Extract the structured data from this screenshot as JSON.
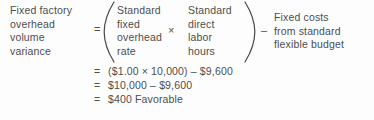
{
  "figure": {
    "type": "accounting-formula",
    "variance_label": {
      "lines": [
        "Fixed factory",
        "overhead",
        "volume",
        "variance"
      ]
    },
    "operators": {
      "equals": "=",
      "times": "×",
      "minus": "–",
      "open_paren": "(",
      "close_paren": ")"
    },
    "factor_one": {
      "lines": [
        "Standard",
        "fixed",
        "overhead",
        "rate"
      ]
    },
    "factor_two": {
      "lines": [
        "Standard",
        "direct",
        "labor",
        "hours"
      ]
    },
    "right_term": {
      "lines": [
        "Fixed costs",
        "from standard",
        "flexible budget"
      ]
    },
    "calculation": [
      {
        "eq": "=",
        "expression": "($1.00  ×  10,000)  –  $9,600"
      },
      {
        "eq": "=",
        "expression": "$10,000  –  $9,600"
      },
      {
        "eq": "=",
        "expression": "$400 Favorable"
      }
    ],
    "colors": {
      "ink": "#4d4d4d",
      "paper": "#fdfdfd"
    }
  }
}
